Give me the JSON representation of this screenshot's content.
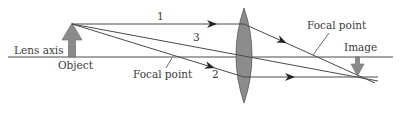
{
  "diagram": {
    "type": "thin-lens ray diagram",
    "labels": {
      "lens_axis": "Lens axis",
      "object": "Object",
      "focal_point_left": "Focal point",
      "focal_point_right": "Focal point",
      "image": "Image",
      "ray_1": "1",
      "ray_2": "2",
      "ray_3": "3"
    },
    "colors": {
      "line": "#4a4a4a",
      "lens_fill": "#8c8c8c",
      "arrow_fill": "#8a8a8a",
      "text": "#3a3a3a"
    }
  }
}
